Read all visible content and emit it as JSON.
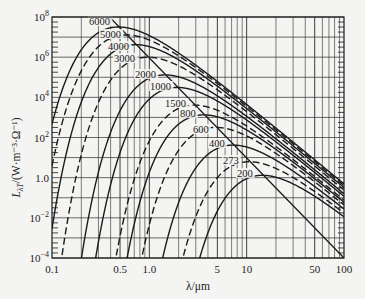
{
  "chart_data": {
    "type": "line",
    "title": "",
    "xlabel": "λ/μm",
    "ylabel": "L_λT/(W·m⁻³·Ω⁻¹)",
    "xscale": "log",
    "yscale": "log",
    "xlim": [
      0.1,
      100
    ],
    "ylim": [
      0.0001,
      100000000
    ],
    "grid": true,
    "x_tick_labels": [
      "0.1",
      "0.5",
      "1.0",
      "5",
      "10",
      "50",
      "100"
    ],
    "x_tick_values": [
      0.1,
      0.5,
      1.0,
      5,
      10,
      50,
      100
    ],
    "y_tick_labels": [
      "10^8",
      "10^6",
      "10^4",
      "10^2",
      "1.0",
      "10^-2",
      "10^-4"
    ],
    "y_tick_values": [
      100000000,
      1000000,
      10000,
      100,
      1.0,
      0.01,
      0.0001
    ],
    "series": [
      {
        "name": "6000",
        "temperature_K": 6000,
        "style": "solid",
        "peak_lambda_um": 0.48,
        "peak_value": 26000000
      },
      {
        "name": "5000",
        "temperature_K": 5000,
        "style": "dashed",
        "peak_lambda_um": 0.58,
        "peak_value": 12500000
      },
      {
        "name": "4000",
        "temperature_K": 4000,
        "style": "solid",
        "peak_lambda_um": 0.72,
        "peak_value": 4100000
      },
      {
        "name": "3000",
        "temperature_K": 3000,
        "style": "dashed",
        "peak_lambda_um": 0.97,
        "peak_value": 980000
      },
      {
        "name": "2000",
        "temperature_K": 2000,
        "style": "solid",
        "peak_lambda_um": 1.45,
        "peak_value": 128000
      },
      {
        "name": "1000",
        "temperature_K": 1000,
        "style": "dashed",
        "peak_lambda_um": 2.9,
        "peak_value": 4000
      },
      {
        "name": "1500",
        "temperature_K": 1500,
        "style": "solid",
        "peak_lambda_um": 1.93,
        "peak_value": 30500
      },
      {
        "name": "800",
        "temperature_K": 800,
        "style": "solid",
        "peak_lambda_um": 3.6,
        "peak_value": 1300
      },
      {
        "name": "600",
        "temperature_K": 600,
        "style": "dashed",
        "peak_lambda_um": 4.8,
        "peak_value": 310
      },
      {
        "name": "400",
        "temperature_K": 400,
        "style": "solid",
        "peak_lambda_um": 7.2,
        "peak_value": 41
      },
      {
        "name": "273",
        "temperature_K": 273,
        "style": "dashed",
        "peak_lambda_um": 10.6,
        "peak_value": 6.1
      },
      {
        "name": "200",
        "temperature_K": 200,
        "style": "solid",
        "peak_lambda_um": 14.5,
        "peak_value": 1.3
      }
    ],
    "annotations": [
      {
        "type": "line",
        "name": "wien-displacement-locus",
        "description": "diagonal straight line through curve maxima",
        "from": [
          0.39,
          100000000
        ],
        "to": [
          100,
          0.0001
        ]
      }
    ],
    "curve_order_note": "Curves alternate solid/dashed; labels placed near each curve peak along the Wien line"
  },
  "labels": {
    "x_axis_title": "λ/μm",
    "y_axis_title": "L",
    "y_axis_sub": "λT",
    "y_axis_units": "/(W·m⁻³·Ω⁻¹)"
  },
  "colors": {
    "background": "#f4f4f2",
    "ink": "#1a1a1a",
    "grid": "#2a2a2a"
  }
}
